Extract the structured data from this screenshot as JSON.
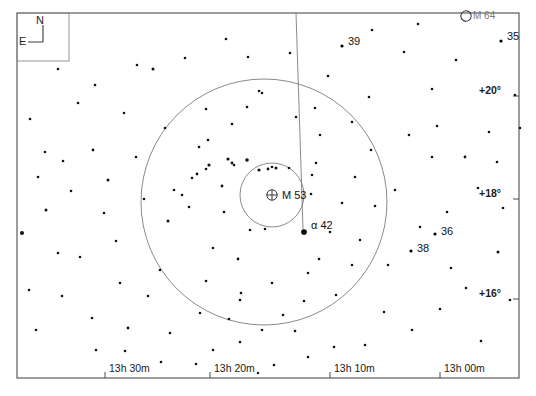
{
  "chart_data": {
    "type": "scatter",
    "xlabel": "Right Ascension",
    "ylabel": "Declination",
    "grid": false,
    "legend": "none",
    "projection": "equatorial star chart",
    "frame": {
      "x": 17,
      "y": 13,
      "width": 502,
      "height": 365
    },
    "ra_axis": {
      "unit": "hours minutes",
      "ticks": [
        {
          "label": "13h 30m",
          "x": 105
        },
        {
          "label": "13h 20m",
          "x": 210
        },
        {
          "label": "13h 10m",
          "x": 330
        },
        {
          "label": "13h 00m",
          "x": 440
        }
      ]
    },
    "dec_axis": {
      "unit": "degrees",
      "ticks": [
        {
          "label": "+20°",
          "y": 96
        },
        {
          "label": "+18°",
          "y": 199
        },
        {
          "label": "+16°",
          "y": 299
        }
      ]
    },
    "compass": {
      "north_label": "N",
      "east_label": "E",
      "box": {
        "x": 17,
        "y": 13,
        "width": 52,
        "height": 48
      }
    },
    "circles": [
      {
        "name": "outer-field-circle",
        "cx": 264,
        "cy": 202,
        "r": 123
      },
      {
        "name": "inner-field-circle",
        "cx": 272,
        "cy": 195,
        "r": 32
      }
    ],
    "meridian_line": {
      "x1": 296,
      "y1": 13,
      "x2": 303,
      "y2": 229
    },
    "deep_sky_objects": [
      {
        "id": "m53",
        "label": "M 53",
        "symbol": "globular-cluster",
        "x": 272,
        "y": 195,
        "label_x": 282,
        "label_y": 190
      },
      {
        "id": "m64",
        "label": "M 64",
        "symbol": "galaxy",
        "x": 466,
        "y": 16,
        "label_x": 473,
        "label_y": 11
      }
    ],
    "labeled_stars": [
      {
        "id": "alpha42",
        "label": "α  42",
        "x": 304,
        "y": 232,
        "mag": 4.3,
        "label_x": 311,
        "label_y": 220
      },
      {
        "id": "star39",
        "label": "39",
        "x": 342,
        "y": 46,
        "mag": 5.8,
        "label_x": 348,
        "label_y": 36
      },
      {
        "id": "star35",
        "label": "35",
        "x": 501,
        "y": 41,
        "mag": 5.6,
        "label_x": 507,
        "label_y": 31
      },
      {
        "id": "star36",
        "label": "36",
        "x": 435,
        "y": 234,
        "mag": 5.9,
        "label_x": 441,
        "label_y": 226
      },
      {
        "id": "star38",
        "label": "38",
        "x": 411,
        "y": 251,
        "mag": 6.0,
        "label_x": 417,
        "label_y": 243
      }
    ],
    "stars": [
      [
        153,
        69,
        1.5
      ],
      [
        124,
        113,
        1.3
      ],
      [
        93,
        150,
        1.4
      ],
      [
        63,
        161,
        1.3
      ],
      [
        45,
        152,
        1.3
      ],
      [
        108,
        180,
        1.5
      ],
      [
        46,
        210,
        1.5
      ],
      [
        22,
        233,
        2.0
      ],
      [
        80,
        257,
        1.3
      ],
      [
        62,
        296,
        1.3
      ],
      [
        92,
        318,
        1.3
      ],
      [
        128,
        328,
        1.4
      ],
      [
        125,
        351,
        1.3
      ],
      [
        148,
        296,
        1.3
      ],
      [
        168,
        221,
        1.5
      ],
      [
        160,
        270,
        1.3
      ],
      [
        170,
        333,
        1.3
      ],
      [
        200,
        313,
        1.3
      ],
      [
        213,
        350,
        1.3
      ],
      [
        240,
        300,
        1.3
      ],
      [
        238,
        259,
        1.4
      ],
      [
        213,
        248,
        1.3
      ],
      [
        222,
        186,
        1.4
      ],
      [
        209,
        165,
        1.6
      ],
      [
        199,
        147,
        1.3
      ],
      [
        208,
        140,
        1.3
      ],
      [
        206,
        169,
        1.3
      ],
      [
        228,
        159,
        1.6
      ],
      [
        232,
        163,
        1.4
      ],
      [
        234,
        165,
        1.3
      ],
      [
        247,
        160,
        1.8
      ],
      [
        197,
        174,
        1.4
      ],
      [
        192,
        178,
        1.3
      ],
      [
        259,
        170,
        1.6
      ],
      [
        268,
        169,
        1.4
      ],
      [
        272,
        167,
        1.3
      ],
      [
        276,
        168,
        1.5
      ],
      [
        250,
        230,
        1.3
      ],
      [
        265,
        229,
        1.3
      ],
      [
        224,
        212,
        1.3
      ],
      [
        189,
        207,
        1.3
      ],
      [
        182,
        195,
        1.3
      ],
      [
        174,
        190,
        1.3
      ],
      [
        289,
        168,
        1.3
      ],
      [
        312,
        175,
        1.3
      ],
      [
        316,
        163,
        1.3
      ],
      [
        342,
        203,
        1.3
      ],
      [
        355,
        177,
        1.3
      ],
      [
        311,
        194,
        1.3
      ],
      [
        319,
        259,
        1.3
      ],
      [
        308,
        273,
        1.3
      ],
      [
        304,
        301,
        1.3
      ],
      [
        283,
        315,
        1.3
      ],
      [
        295,
        331,
        1.3
      ],
      [
        262,
        330,
        1.3
      ],
      [
        241,
        293,
        1.3
      ],
      [
        206,
        281,
        1.3
      ],
      [
        232,
        124,
        1.3
      ],
      [
        247,
        107,
        1.3
      ],
      [
        259,
        91,
        1.3
      ],
      [
        296,
        117,
        1.3
      ],
      [
        315,
        108,
        1.3
      ],
      [
        328,
        76,
        1.3
      ],
      [
        320,
        135,
        1.3
      ],
      [
        352,
        122,
        1.3
      ],
      [
        360,
        240,
        1.3
      ],
      [
        375,
        206,
        1.3
      ],
      [
        395,
        190,
        1.3
      ],
      [
        409,
        135,
        1.3
      ],
      [
        437,
        126,
        1.3
      ],
      [
        420,
        227,
        1.3
      ],
      [
        447,
        212,
        1.3
      ],
      [
        432,
        157,
        1.3
      ],
      [
        465,
        157,
        1.4
      ],
      [
        489,
        132,
        1.3
      ],
      [
        497,
        162,
        1.3
      ],
      [
        478,
        188,
        1.3
      ],
      [
        503,
        208,
        1.3
      ],
      [
        498,
        252,
        1.5
      ],
      [
        466,
        288,
        1.3
      ],
      [
        440,
        309,
        1.3
      ],
      [
        412,
        330,
        1.3
      ],
      [
        384,
        312,
        1.3
      ],
      [
        365,
        345,
        1.3
      ],
      [
        334,
        347,
        1.3
      ],
      [
        308,
        357,
        1.3
      ],
      [
        274,
        365,
        1.3
      ],
      [
        240,
        342,
        1.3
      ],
      [
        196,
        364,
        1.3
      ],
      [
        161,
        362,
        1.3
      ],
      [
        96,
        350,
        1.3
      ],
      [
        36,
        330,
        1.3
      ],
      [
        29,
        290,
        1.3
      ],
      [
        30,
        119,
        1.3
      ],
      [
        95,
        85,
        1.3
      ],
      [
        137,
        65,
        1.3
      ],
      [
        185,
        58,
        1.3
      ],
      [
        226,
        39,
        1.3
      ],
      [
        248,
        57,
        1.3
      ],
      [
        290,
        53,
        1.3
      ],
      [
        372,
        30,
        1.3
      ],
      [
        404,
        52,
        1.3
      ],
      [
        418,
        24,
        1.3
      ],
      [
        456,
        60,
        1.3
      ],
      [
        432,
        89,
        1.3
      ],
      [
        369,
        97,
        1.3
      ],
      [
        262,
        93,
        1.3
      ],
      [
        116,
        241,
        1.3
      ],
      [
        136,
        157,
        1.3
      ],
      [
        78,
        103,
        1.3
      ],
      [
        58,
        69,
        1.3
      ],
      [
        515,
        95,
        1.3
      ],
      [
        520,
        128,
        1.3
      ],
      [
        510,
        300,
        1.3
      ],
      [
        481,
        341,
        1.3
      ],
      [
        451,
        268,
        1.3
      ],
      [
        336,
        295,
        1.3
      ],
      [
        352,
        265,
        1.3
      ],
      [
        388,
        265,
        1.3
      ],
      [
        272,
        283,
        1.3
      ],
      [
        206,
        109,
        1.3
      ],
      [
        165,
        128,
        1.3
      ],
      [
        144,
        199,
        1.3
      ],
      [
        120,
        283,
        1.3
      ],
      [
        58,
        253,
        1.3
      ],
      [
        38,
        177,
        1.3
      ],
      [
        71,
        191,
        1.3
      ],
      [
        104,
        213,
        1.3
      ],
      [
        258,
        373,
        1.2
      ],
      [
        229,
        319,
        1.3
      ],
      [
        330,
        232,
        1.3
      ],
      [
        371,
        150,
        1.3
      ]
    ]
  }
}
